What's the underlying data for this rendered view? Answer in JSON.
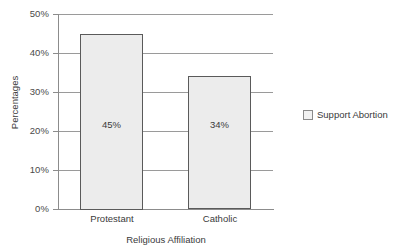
{
  "chart_data": {
    "type": "bar",
    "title": "",
    "subtitle": "",
    "categories": [
      "Protestant",
      "Catholic"
    ],
    "values": [
      45,
      34
    ],
    "value_labels": [
      "45%",
      "34%"
    ],
    "series": [
      {
        "name": "Support Abortion",
        "values": [
          45,
          34
        ]
      }
    ],
    "xlabel": "Religious Affiliation",
    "ylabel": "Percentages",
    "ylim": [
      0,
      50
    ],
    "ytick_values": [
      0,
      10,
      20,
      30,
      40,
      50
    ],
    "ytick_labels": [
      "0%",
      "10%",
      "20%",
      "30%",
      "40%",
      "50%"
    ],
    "grid": true,
    "grid_axis": "y",
    "legend": {
      "position": "right",
      "entries": [
        {
          "label": "Support Abortion",
          "color": "#ececec"
        }
      ]
    },
    "colors": {
      "bar_fill": "#ececec",
      "bar_border": "#5a5a5a",
      "gridline": "#9a9a9a",
      "axis": "#8c8c8c",
      "text": "#3a3a3a",
      "background": "#ffffff"
    }
  }
}
